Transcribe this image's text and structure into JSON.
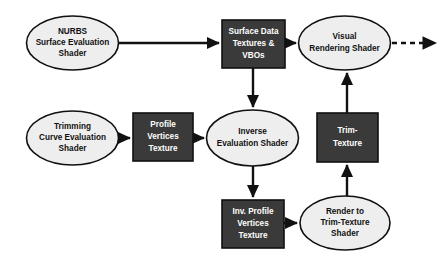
{
  "diagram": {
    "background_color": "#ffffff",
    "ellipse_fill": "#eeeeee",
    "box_fill": "#3a3a3a",
    "stroke_color": "#111111",
    "nodes": [
      {
        "id": "nurbs-surface-evaluation-shader",
        "shape": "ellipse",
        "style": "light",
        "lines": [
          "NURBS",
          "Surface Evaluation",
          "Shader"
        ],
        "cx": 72.5,
        "cy": 43,
        "rx": 46,
        "ry": 27
      },
      {
        "id": "surface-data-textures-vbos",
        "shape": "box",
        "style": "dark",
        "lines": [
          "Surface Data",
          "Textures &",
          "VBOs"
        ],
        "x": 222,
        "y": 20,
        "w": 63,
        "h": 48
      },
      {
        "id": "visual-rendering-shader",
        "shape": "ellipse",
        "style": "light",
        "lines": [
          "Visual",
          "Rendering Shader"
        ],
        "cx": 344.5,
        "cy": 43,
        "rx": 46,
        "ry": 27
      },
      {
        "id": "trimming-curve-evaluation-shader",
        "shape": "ellipse",
        "style": "light",
        "lines": [
          "Trimming",
          "Curve Evaluation",
          "Shader"
        ],
        "cx": 72.5,
        "cy": 138,
        "rx": 46,
        "ry": 27
      },
      {
        "id": "profile-vertices-texture",
        "shape": "box",
        "style": "dark",
        "lines": [
          "Profile",
          "Vertices",
          "Texture"
        ],
        "x": 133,
        "y": 113,
        "w": 60,
        "h": 48
      },
      {
        "id": "inverse-evaluation-shader",
        "shape": "ellipse",
        "style": "light",
        "lines": [
          "Inverse",
          "Evaluation Shader"
        ],
        "cx": 252.5,
        "cy": 138,
        "rx": 46,
        "ry": 28
      },
      {
        "id": "trim-texture",
        "shape": "box",
        "style": "dark",
        "lines": [
          "Trim-",
          "Texture"
        ],
        "x": 317,
        "y": 113,
        "w": 61,
        "h": 49
      },
      {
        "id": "inv-profile-vertices-texture",
        "shape": "box",
        "style": "dark",
        "lines": [
          "Inv. Profile",
          "Vertices",
          "Texture"
        ],
        "x": 222,
        "y": 200,
        "w": 62,
        "h": 48
      },
      {
        "id": "render-to-trim-texture-shader",
        "shape": "ellipse",
        "style": "light",
        "lines": [
          "Render to",
          "Trim-Texture",
          "Shader"
        ],
        "cx": 345,
        "cy": 223,
        "rx": 45,
        "ry": 27
      }
    ],
    "edges": [
      {
        "id": "edge-nurbs-to-surface-data",
        "from": "nurbs-surface-evaluation-shader",
        "to": "surface-data-textures-vbos",
        "style": "solid",
        "direction": "right"
      },
      {
        "id": "edge-surface-data-to-visual-rendering",
        "from": "surface-data-textures-vbos",
        "to": "visual-rendering-shader",
        "style": "solid",
        "direction": "right"
      },
      {
        "id": "edge-visual-rendering-to-output",
        "from": "visual-rendering-shader",
        "to": "output",
        "style": "dashed",
        "direction": "right"
      },
      {
        "id": "edge-surface-data-to-inverse-evaluation",
        "from": "surface-data-textures-vbos",
        "to": "inverse-evaluation-shader",
        "style": "solid",
        "direction": "down"
      },
      {
        "id": "edge-trimming-to-profile-vertices",
        "from": "trimming-curve-evaluation-shader",
        "to": "profile-vertices-texture",
        "style": "solid",
        "direction": "right"
      },
      {
        "id": "edge-profile-vertices-to-inverse-evaluation",
        "from": "profile-vertices-texture",
        "to": "inverse-evaluation-shader",
        "style": "solid",
        "direction": "right"
      },
      {
        "id": "edge-inverse-evaluation-to-inv-profile",
        "from": "inverse-evaluation-shader",
        "to": "inv-profile-vertices-texture",
        "style": "solid",
        "direction": "down"
      },
      {
        "id": "edge-inv-profile-to-render-trim",
        "from": "inv-profile-vertices-texture",
        "to": "render-to-trim-texture-shader",
        "style": "solid",
        "direction": "right"
      },
      {
        "id": "edge-render-trim-to-trim-texture",
        "from": "render-to-trim-texture-shader",
        "to": "trim-texture",
        "style": "solid",
        "direction": "up"
      },
      {
        "id": "edge-trim-texture-to-visual-rendering",
        "from": "trim-texture",
        "to": "visual-rendering-shader",
        "style": "solid",
        "direction": "up"
      }
    ]
  }
}
